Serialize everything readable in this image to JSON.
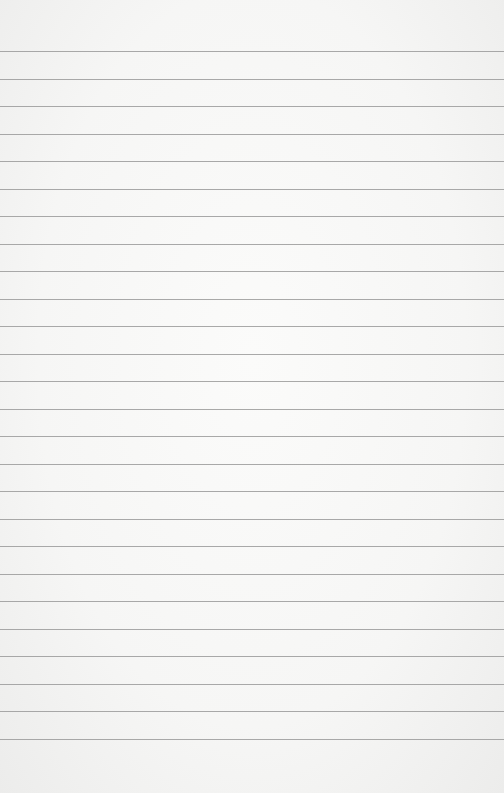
{
  "paper": {
    "type": "lined notebook paper",
    "background_color": "#f6f6f5",
    "rule_color": "#9a9a9a",
    "rule_count": 26,
    "first_rule_y": 51,
    "rule_spacing": 27.52
  }
}
